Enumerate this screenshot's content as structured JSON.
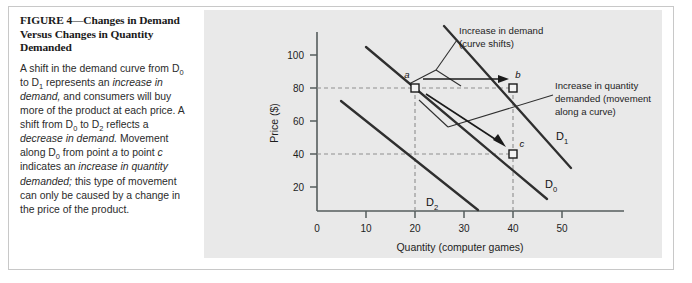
{
  "figure": {
    "title_prefix": "FIGURE 4",
    "title_dash": "—",
    "title_rest": "Changes in Demand Versus Changes in Quantity Demanded",
    "caption_segments": [
      {
        "text": "A shift in the demand curve from D",
        "style": "normal"
      },
      {
        "text": "0",
        "style": "sub"
      },
      {
        "text": " to D",
        "style": "normal"
      },
      {
        "text": "1",
        "style": "sub"
      },
      {
        "text": " represents an ",
        "style": "normal"
      },
      {
        "text": "increase in demand,",
        "style": "italic"
      },
      {
        "text": " and consumers will buy more of the product at each price. A shift from D",
        "style": "normal"
      },
      {
        "text": "0",
        "style": "sub"
      },
      {
        "text": " to D",
        "style": "normal"
      },
      {
        "text": "2",
        "style": "sub"
      },
      {
        "text": " reflects a ",
        "style": "normal"
      },
      {
        "text": "decrease in demand.",
        "style": "italic"
      },
      {
        "text": " Movement along D",
        "style": "normal"
      },
      {
        "text": "0",
        "style": "sub"
      },
      {
        "text": " from point ",
        "style": "normal"
      },
      {
        "text": "a",
        "style": "italic"
      },
      {
        "text": " to point ",
        "style": "normal"
      },
      {
        "text": "c",
        "style": "italic"
      },
      {
        "text": " indicates an ",
        "style": "normal"
      },
      {
        "text": "increase in quantity demanded;",
        "style": "italic"
      },
      {
        "text": " this type of movement can only be caused by a change in the price of the product.",
        "style": "normal"
      }
    ]
  },
  "chart_data": {
    "type": "line",
    "title": "",
    "xlabel": "Quantity (computer games)",
    "ylabel": "Price ($)",
    "xlim": [
      0,
      55
    ],
    "ylim": [
      0,
      112
    ],
    "xticks": [
      10,
      20,
      30,
      40,
      50
    ],
    "xticklabels": [
      "10",
      "20",
      "30",
      "40",
      "50"
    ],
    "yticks": [
      20,
      40,
      60,
      80,
      100
    ],
    "yticklabels": [
      "20",
      "40",
      "60",
      "80",
      "100"
    ],
    "origin_label": "0",
    "grid": false,
    "legend": "inline-curve-labels",
    "series": [
      {
        "name": "D0",
        "label": "D",
        "label_sub": "0",
        "x": [
          10,
          47
        ],
        "y": [
          105,
          13
        ],
        "note": "original demand curve through points a and c"
      },
      {
        "name": "D1",
        "label": "D",
        "label_sub": "1",
        "x": [
          26,
          52
        ],
        "y": [
          118,
          26
        ],
        "note": "increased demand curve through point b"
      },
      {
        "name": "D2",
        "label": "D",
        "label_sub": "2",
        "x": [
          5,
          33
        ],
        "y": [
          72,
          6
        ],
        "note": "decreased demand curve"
      }
    ],
    "points": [
      {
        "label": "a",
        "x": 20,
        "y": 80,
        "curve": "D0"
      },
      {
        "label": "b",
        "x": 40,
        "y": 80,
        "curve": "D1"
      },
      {
        "label": "c",
        "x": 40,
        "y": 40,
        "curve": "D0"
      }
    ],
    "guide_lines": [
      {
        "type": "horizontal",
        "value": 80
      },
      {
        "type": "horizontal",
        "value": 40
      },
      {
        "type": "vertical",
        "value": 20
      },
      {
        "type": "vertical",
        "value": 40
      }
    ],
    "annotations": [
      {
        "id": "increase-in-demand",
        "lines": [
          "Increase in demand",
          "(curve shifts)"
        ],
        "arrow": "from point a to point b (horizontal right)"
      },
      {
        "id": "increase-in-quantity-demanded",
        "lines": [
          "Increase in quantity",
          "demanded (movement",
          "along a curve)"
        ],
        "arrow": "from point a down along D0 to point c"
      }
    ]
  }
}
